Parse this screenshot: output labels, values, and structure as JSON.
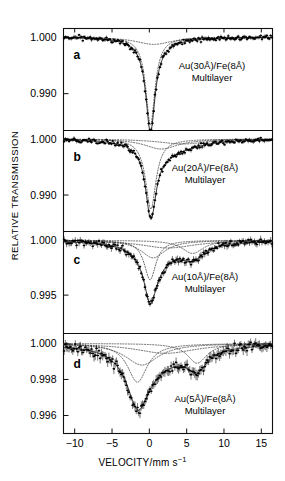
{
  "figure": {
    "title": "",
    "axis_titles": {
      "y": "RELATIVE TRANSMISSION",
      "x_main": "VELOCITY/mm s",
      "x_exponent": "−1"
    }
  },
  "x_axis": {
    "label": "VELOCITY/mm s−1",
    "min": -11.5,
    "max": 16.5,
    "ticks": [
      -10,
      -5,
      0,
      5,
      10,
      15
    ],
    "tick_labels": [
      "−10",
      "−5",
      "0",
      "5",
      "10",
      "15"
    ]
  },
  "panels": [
    {
      "letter": "a",
      "sample_line1": "Au(30Å)/Fe(8Å)",
      "sample_line2": "Multilayer",
      "y_ticks": [
        1.0,
        0.99
      ],
      "y_tick_labels": [
        "1.000",
        "0.990"
      ],
      "y_min": 0.9835,
      "y_max": 1.0015
    },
    {
      "letter": "b",
      "sample_line1": "Au(20Å)/Fe(8Å)",
      "sample_line2": "Multilayer",
      "y_ticks": [
        1.0,
        0.99
      ],
      "y_tick_labels": [
        "1.000",
        "0.990"
      ],
      "y_min": 0.9835,
      "y_max": 1.0015
    },
    {
      "letter": "c",
      "sample_line1": "Au(10Å)/Fe(8Å)",
      "sample_line2": "Multilayer",
      "y_ticks": [
        1.0,
        0.995
      ],
      "y_tick_labels": [
        "1.000",
        "0.995"
      ],
      "y_min": 0.9915,
      "y_max": 1.0008
    },
    {
      "letter": "d",
      "sample_line1": "Au(5Å)/Fe(8Å)",
      "sample_line2": "Multilayer",
      "y_ticks": [
        1.0,
        0.998,
        0.996
      ],
      "y_tick_labels": [
        "1.000",
        "0.998",
        "0.996"
      ],
      "y_min": 0.995,
      "y_max": 1.00055
    }
  ],
  "chart_data": {
    "type": "line",
    "title": "",
    "xlabel": "VELOCITY/mm s−1",
    "ylabel": "RELATIVE TRANSMISSION",
    "xlim": [
      -11.5,
      16.5
    ],
    "grid": false,
    "legend": "none",
    "subplots": [
      {
        "panel": "a",
        "ylim": [
          0.9835,
          1.0015
        ],
        "yticks": [
          1.0,
          0.99
        ],
        "annotation": "Au(30Å)/Fe(8Å) Multilayer",
        "baseline": 1.0,
        "components": [
          {
            "name": "narrow-doublet",
            "center": 0.15,
            "depth": 0.0155,
            "width": 1.5,
            "style": "dotted"
          },
          {
            "name": "broad-background",
            "center": 0.6,
            "depth": 0.0013,
            "width": 6.0,
            "style": "dotted"
          }
        ],
        "series": [
          {
            "name": "fit-envelope",
            "style": "solid"
          },
          {
            "name": "data-points",
            "style": "points-with-error-bars"
          }
        ]
      },
      {
        "panel": "b",
        "ylim": [
          0.9835,
          1.0015
        ],
        "yticks": [
          1.0,
          0.99
        ],
        "annotation": "Au(20Å)/Fe(8Å) Multilayer",
        "baseline": 1.0,
        "components": [
          {
            "name": "narrow-doublet",
            "center": 0.2,
            "depth": 0.0125,
            "width": 1.7,
            "style": "dotted"
          },
          {
            "name": "broad-component",
            "center": 1.6,
            "depth": 0.0018,
            "width": 5.5,
            "style": "dotted"
          },
          {
            "name": "very-broad-component",
            "center": 4.5,
            "depth": 0.0009,
            "width": 8.0,
            "style": "dotted"
          }
        ],
        "series": [
          {
            "name": "fit-envelope",
            "style": "solid"
          },
          {
            "name": "data-points",
            "style": "points-with-error-bars"
          }
        ]
      },
      {
        "panel": "c",
        "ylim": [
          0.9915,
          1.0008
        ],
        "yticks": [
          1.0,
          0.995
        ],
        "annotation": "Au(10Å)/Fe(8Å) Multilayer",
        "baseline": 1.0,
        "components": [
          {
            "name": "narrow-doublet",
            "center": 0.1,
            "depth": 0.0036,
            "width": 1.9,
            "style": "dotted"
          },
          {
            "name": "mid-component",
            "center": 0.5,
            "depth": 0.0016,
            "width": 4.0,
            "style": "dotted"
          },
          {
            "name": "high-velocity-component",
            "center": 5.8,
            "depth": 0.0012,
            "width": 3.5,
            "style": "dotted"
          },
          {
            "name": "broad-background",
            "center": 2.5,
            "depth": 0.0007,
            "width": 9.0,
            "style": "dotted"
          }
        ],
        "series": [
          {
            "name": "fit-envelope",
            "style": "solid"
          },
          {
            "name": "data-points",
            "style": "points-with-error-bars"
          }
        ]
      },
      {
        "panel": "d",
        "ylim": [
          0.995,
          1.00055
        ],
        "yticks": [
          1.0,
          0.998,
          0.996
        ],
        "annotation": "Au(5Å)/Fe(8Å) Multilayer",
        "baseline": 1.0,
        "components": [
          {
            "name": "low-velocity-line",
            "center": -1.6,
            "depth": 0.00215,
            "width": 3.2,
            "style": "dotted"
          },
          {
            "name": "central-line",
            "center": -1.0,
            "depth": 0.0012,
            "width": 5.5,
            "style": "dotted"
          },
          {
            "name": "high-velocity-line",
            "center": 6.4,
            "depth": 0.0011,
            "width": 3.2,
            "style": "dotted"
          },
          {
            "name": "broad-background",
            "center": 2.2,
            "depth": 0.00055,
            "width": 10.0,
            "style": "dotted"
          }
        ],
        "series": [
          {
            "name": "fit-envelope",
            "style": "solid"
          },
          {
            "name": "data-points",
            "style": "points-with-error-bars"
          }
        ]
      }
    ]
  }
}
